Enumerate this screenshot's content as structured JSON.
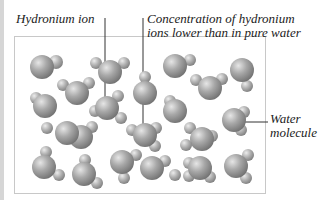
{
  "labels": {
    "hydronium": "Hydronium ion",
    "concentration_line1": "Concentration of hydronium",
    "concentration_line2": "ions lower than in pure water",
    "water_line1": "Water",
    "water_line2": "molecule"
  },
  "colors": {
    "oxygen": "#8c8c8c",
    "hydrogen": "#9a9a9a",
    "leader": "#333333",
    "box": "#c8c8c8"
  }
}
